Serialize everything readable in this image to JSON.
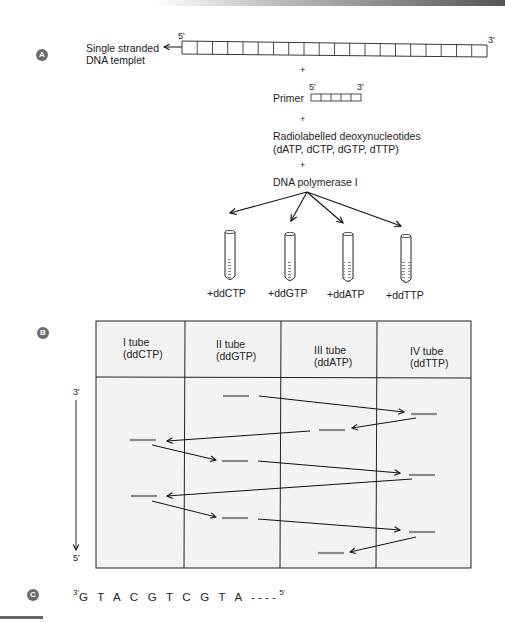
{
  "panel_labels": {
    "a": "A",
    "b": "B",
    "c": "C"
  },
  "panel_a": {
    "template_label_line1": "Single stranded",
    "template_label_line2": "DNA templet",
    "template_5_prime": "5'",
    "template_3_prime": "3'",
    "template_box_count": 20,
    "plus1": "+",
    "primer_label": "Primer",
    "primer_5_prime": "5'",
    "primer_3_prime": "3'",
    "primer_box_count": 5,
    "plus2": "+",
    "nucleotides_line1": "Radiolabelled deoxynucleotides",
    "nucleotides_line2": "(dATP, dCTP, dGTP, dTTP)",
    "plus3": "+",
    "enzyme_label": "DNA polymerase I",
    "tubes": [
      {
        "label": "+ddCTP"
      },
      {
        "label": "+ddGTP"
      },
      {
        "label": "+ddATP"
      },
      {
        "label": "+ddTTP"
      }
    ]
  },
  "panel_b": {
    "columns": [
      {
        "line1": "I tube",
        "line2": "(ddCTP)"
      },
      {
        "line1": "II tube",
        "line2": "(ddGTP)"
      },
      {
        "line1": "III tube",
        "line2": "(ddATP)"
      },
      {
        "line1": "IV tube",
        "line2": "(ddTTP)"
      }
    ],
    "axis_top": "3'",
    "axis_bottom": "5'",
    "band_order": [
      "G",
      "T",
      "A",
      "C",
      "G",
      "T",
      "C",
      "G",
      "T",
      "A"
    ]
  },
  "panel_c": {
    "prime_start": "3'",
    "sequence": "G T A C G T C G T A ----",
    "prime_end": "5'"
  }
}
